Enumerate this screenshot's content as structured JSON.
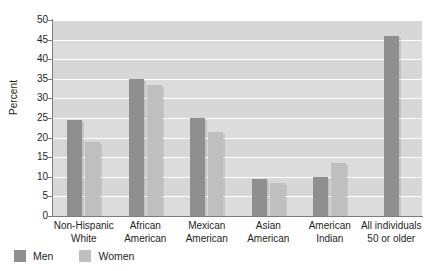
{
  "chart_data": {
    "type": "bar",
    "title": "",
    "subtitle": "",
    "xlabel": "",
    "ylabel": "Percent",
    "ylim": [
      0,
      50
    ],
    "ytick_step": 5,
    "yticks": [
      50,
      45,
      40,
      35,
      30,
      25,
      20,
      15,
      10,
      5,
      0
    ],
    "grid": true,
    "legend_position": "bottom-left",
    "categories": [
      "Non-Hispanic White",
      "African American",
      "Mexican American",
      "Asian American",
      "American Indian",
      "All individuals 50 or older"
    ],
    "category_lines": [
      [
        "Non-Hispanic",
        "White"
      ],
      [
        "African",
        "American"
      ],
      [
        "Mexican",
        "American"
      ],
      [
        "Asian",
        "American"
      ],
      [
        "American",
        "Indian"
      ],
      [
        "All individuals",
        "50 or older"
      ]
    ],
    "series": [
      {
        "name": "Men",
        "color": "#8f8f8f",
        "values": [
          24.5,
          35,
          25,
          9.5,
          10,
          46
        ]
      },
      {
        "name": "Women",
        "color": "#bfbfbf",
        "values": [
          19,
          33.5,
          21.5,
          8.5,
          13.5,
          null
        ]
      }
    ]
  },
  "legend": {
    "items": [
      {
        "label": "Men",
        "swatch": "men-swatch"
      },
      {
        "label": "Women",
        "swatch": "women-swatch"
      }
    ]
  },
  "colors": {
    "men": "#8f8f8f",
    "women": "#bfbfbf",
    "plot_background": "#dcdcdc",
    "gridline": "#ffffff",
    "axis": "#7d7d7d",
    "text": "#231f20"
  }
}
